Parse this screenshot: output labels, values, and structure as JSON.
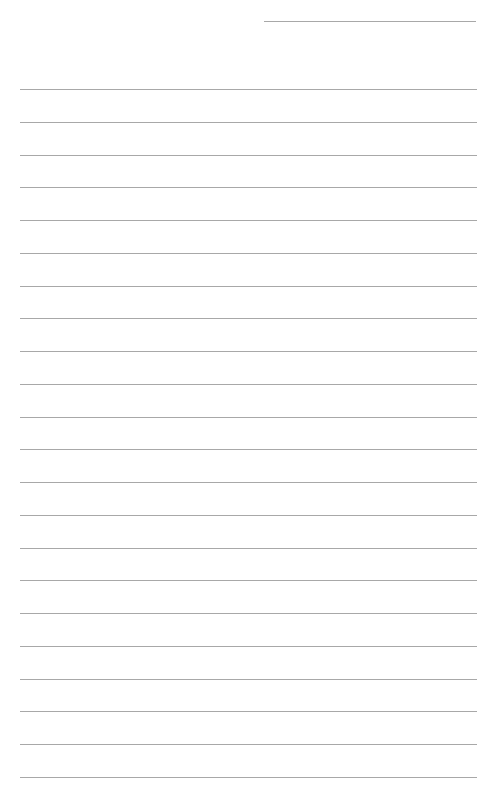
{
  "page": {
    "type": "lined-paper",
    "background_color": "#ffffff",
    "line_color": "#a8a8a8",
    "header_line": {
      "left": 264,
      "top": 21,
      "width": 212
    },
    "rules": {
      "count": 22,
      "first_top": 89,
      "spacing": 32.76,
      "left": 20,
      "width": 457
    }
  }
}
